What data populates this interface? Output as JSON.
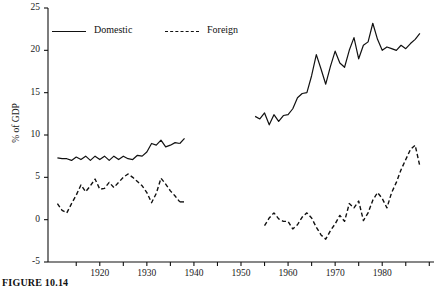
{
  "figure": {
    "caption": "FIGURE 10.14"
  },
  "chart_data": {
    "type": "line",
    "title": "",
    "xlabel": "",
    "ylabel": "% of GDP",
    "xlim": [
      1909,
      1991
    ],
    "ylim": [
      -5,
      25
    ],
    "grid": false,
    "legend_position": "top-left-inside",
    "y_ticks": [
      -5,
      0,
      5,
      10,
      15,
      20,
      25
    ],
    "y_tick_labels": [
      "-5",
      "0",
      "5",
      "10",
      "15",
      "20",
      "25"
    ],
    "x_ticks": [
      1915,
      1920,
      1925,
      1930,
      1935,
      1940,
      1945,
      1950,
      1955,
      1960,
      1965,
      1970,
      1975,
      1980,
      1985,
      1990
    ],
    "x_tick_labels": [
      "",
      "1920",
      "",
      "1930",
      "",
      "1940",
      "",
      "1950",
      "",
      "1960",
      "",
      "1970",
      "",
      "1980",
      "",
      ""
    ],
    "x_labeled_ticks": [
      1920,
      1930,
      1940,
      1950,
      1960,
      1970,
      1980
    ],
    "note": "Data series are interrupted between 1938 and 1953 (no plotted values).",
    "series": [
      {
        "name": "Domestic",
        "style": "solid",
        "color": "#111111",
        "segments": [
          {
            "x": [
              1911,
              1912,
              1913,
              1914,
              1915,
              1916,
              1917,
              1918,
              1919,
              1920,
              1921,
              1922,
              1923,
              1924,
              1925,
              1926,
              1927,
              1928,
              1929,
              1930,
              1931,
              1932,
              1933,
              1934,
              1935,
              1936,
              1937
            ],
            "y": [
              7.3,
              7.2,
              7.2,
              7.0,
              7.4,
              7.1,
              7.5,
              7.0,
              7.5,
              7.1,
              7.5,
              7.0,
              7.5,
              7.1,
              7.5,
              7.2,
              7.1,
              7.6,
              7.5,
              8.0,
              9.0,
              8.8,
              9.4,
              8.6,
              8.8,
              9.1,
              9.0
            ]
          },
          {
            "x": [
              1937,
              1938
            ],
            "y": [
              9.0,
              9.6
            ]
          }
        ],
        "segments_right": [
          {
            "x": [
              1953,
              1954,
              1955,
              1956,
              1957,
              1958,
              1959,
              1960,
              1961,
              1962,
              1963,
              1964,
              1965,
              1966,
              1967,
              1968,
              1969,
              1970,
              1971,
              1972,
              1973,
              1974,
              1975,
              1976,
              1977,
              1978,
              1979,
              1980,
              1981,
              1982,
              1983,
              1984,
              1985,
              1986,
              1987,
              1988
            ],
            "y": [
              12.2,
              11.9,
              12.6,
              11.2,
              12.4,
              11.6,
              12.3,
              12.4,
              13.1,
              14.4,
              14.9,
              15.0,
              17.0,
              19.5,
              17.8,
              16.0,
              18.1,
              19.9,
              18.5,
              18.0,
              20.0,
              21.5,
              19.0,
              20.6,
              21.0,
              23.2,
              21.3,
              20.0,
              20.4,
              20.2,
              20.0,
              20.6,
              20.2,
              20.8,
              21.3,
              22.0
            ]
          }
        ]
      },
      {
        "name": "Foreign",
        "style": "dashed",
        "color": "#111111",
        "segments": [
          {
            "x": [
              1911,
              1912,
              1913,
              1914,
              1915,
              1916,
              1917,
              1918,
              1919,
              1920,
              1921,
              1922,
              1923,
              1924,
              1925,
              1926,
              1927,
              1928,
              1929,
              1930,
              1931,
              1932,
              1933,
              1934,
              1935,
              1936,
              1937
            ],
            "y": [
              1.9,
              1.1,
              0.8,
              1.9,
              2.9,
              4.1,
              3.3,
              4.0,
              4.8,
              3.6,
              3.7,
              4.4,
              3.8,
              4.4,
              5.0,
              5.4,
              5.0,
              4.5,
              4.0,
              3.2,
              2.0,
              3.1,
              4.9,
              4.2,
              3.4,
              2.8,
              2.1
            ]
          },
          {
            "x": [
              1937,
              1938
            ],
            "y": [
              2.1,
              2.1
            ]
          }
        ],
        "segments_right": [
          {
            "x": [
              1955,
              1956,
              1957,
              1958,
              1959,
              1960,
              1961,
              1962,
              1963,
              1964,
              1965,
              1966,
              1967,
              1968,
              1969,
              1970,
              1971,
              1972,
              1973,
              1974,
              1975,
              1976,
              1977,
              1978,
              1979,
              1980,
              1981,
              1982,
              1983,
              1984,
              1985,
              1986,
              1987,
              1988
            ],
            "y": [
              -0.7,
              0.2,
              0.8,
              0.1,
              -0.2,
              -0.2,
              -1.1,
              -0.6,
              0.3,
              0.8,
              0.2,
              -0.9,
              -1.8,
              -2.3,
              -1.3,
              -0.5,
              0.5,
              -0.2,
              1.9,
              1.4,
              2.2,
              -0.1,
              0.8,
              2.3,
              3.2,
              2.5,
              1.4,
              3.2,
              4.4,
              5.9,
              7.1,
              8.3,
              8.8,
              6.3
            ]
          }
        ]
      }
    ],
    "legend": [
      {
        "label": "Domestic",
        "style": "solid"
      },
      {
        "label": "Foreign",
        "style": "dashed"
      }
    ]
  }
}
